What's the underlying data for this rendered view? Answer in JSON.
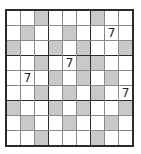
{
  "window": {
    "background": "#ffffff"
  },
  "puzzle": {
    "kind": "sudoku-grid-9x9-with-shaded-cells",
    "size": 9,
    "box_size": 3,
    "rows": [
      "..#...#..",
      ".#..#..7.",
      "#..#.#..#",
      "..#.7##..",
      ".7.#.#.#.",
      "..#.#.#.7",
      "#..#.#..#",
      ".#..#..#.",
      "..#...#.."
    ],
    "shaded_char": "#",
    "empty_char": ".",
    "givens": [
      {
        "row": 2,
        "col": 8,
        "value": "7"
      },
      {
        "row": 4,
        "col": 5,
        "value": "7"
      },
      {
        "row": 5,
        "col": 2,
        "value": "7"
      },
      {
        "row": 6,
        "col": 9,
        "value": "7"
      }
    ],
    "colors": {
      "shaded": "#c9c9c9",
      "cell": "#ffffff",
      "grid_line": "#8a8a8a",
      "box_border": "#2b2b2b",
      "digit": "#222222"
    }
  }
}
